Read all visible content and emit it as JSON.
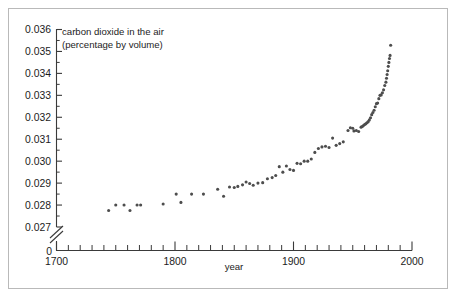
{
  "chart_data": {
    "type": "scatter",
    "title": "carbon dioxide in the air",
    "subtitle": "(percentage by volume)",
    "xlabel": "year",
    "ylabel": "",
    "xlim": [
      1700,
      2000
    ],
    "ylim": [
      0.027,
      0.036
    ],
    "y_axis_break": true,
    "y_axis_zero_label": "0",
    "grid": false,
    "legend": null,
    "x_ticks": [
      1700,
      1800,
      1900,
      2000
    ],
    "x_tick_labels": [
      "1700",
      "1800",
      "1900",
      "2000"
    ],
    "x_minor_tick_step": 10,
    "y_ticks": [
      0.027,
      0.028,
      0.029,
      0.03,
      0.031,
      0.032,
      0.033,
      0.034,
      0.035,
      0.036
    ],
    "y_tick_labels": [
      "0.027",
      "0.028",
      "0.029",
      "0.030",
      "0.031",
      "0.032",
      "0.033",
      "0.034",
      "0.035",
      "0.036"
    ],
    "y_minor_tick_step": 0.0005,
    "marker_color": "#4d4d4d",
    "marker_size": 3.1,
    "points": [
      [
        1744,
        0.02775
      ],
      [
        1750,
        0.028
      ],
      [
        1757,
        0.028
      ],
      [
        1762,
        0.02775
      ],
      [
        1768,
        0.028
      ],
      [
        1771,
        0.028
      ],
      [
        1790,
        0.02805
      ],
      [
        1801,
        0.0285
      ],
      [
        1805,
        0.02812
      ],
      [
        1814,
        0.0285
      ],
      [
        1824,
        0.0285
      ],
      [
        1836,
        0.02872
      ],
      [
        1841,
        0.0284
      ],
      [
        1846,
        0.02882
      ],
      [
        1850,
        0.0288
      ],
      [
        1853,
        0.02885
      ],
      [
        1857,
        0.02892
      ],
      [
        1860,
        0.02905
      ],
      [
        1863,
        0.02898
      ],
      [
        1866,
        0.0289
      ],
      [
        1870,
        0.029
      ],
      [
        1874,
        0.02902
      ],
      [
        1878,
        0.0292
      ],
      [
        1882,
        0.02925
      ],
      [
        1885,
        0.02935
      ],
      [
        1888,
        0.02975
      ],
      [
        1891,
        0.0295
      ],
      [
        1894,
        0.02978
      ],
      [
        1897,
        0.02962
      ],
      [
        1900,
        0.02958
      ],
      [
        1903,
        0.0299
      ],
      [
        1906,
        0.02988
      ],
      [
        1909,
        0.03
      ],
      [
        1912,
        0.03
      ],
      [
        1915,
        0.0301
      ],
      [
        1918,
        0.0304
      ],
      [
        1921,
        0.03058
      ],
      [
        1924,
        0.03065
      ],
      [
        1927,
        0.03068
      ],
      [
        1930,
        0.03062
      ],
      [
        1933,
        0.03105
      ],
      [
        1936,
        0.03072
      ],
      [
        1939,
        0.0308
      ],
      [
        1942,
        0.03088
      ],
      [
        1946,
        0.0314
      ],
      [
        1948,
        0.03152
      ],
      [
        1950,
        0.0315
      ],
      [
        1951,
        0.03138
      ],
      [
        1953,
        0.0314
      ],
      [
        1955,
        0.03135
      ],
      [
        1957,
        0.03155
      ],
      [
        1958,
        0.03158
      ],
      [
        1959,
        0.03162
      ],
      [
        1960,
        0.03167
      ],
      [
        1961,
        0.0317
      ],
      [
        1962,
        0.03175
      ],
      [
        1963,
        0.0318
      ],
      [
        1964,
        0.03188
      ],
      [
        1965,
        0.03198
      ],
      [
        1966,
        0.03212
      ],
      [
        1967,
        0.03222
      ],
      [
        1968,
        0.03232
      ],
      [
        1969,
        0.03248
      ],
      [
        1970,
        0.03262
      ],
      [
        1971,
        0.03265
      ],
      [
        1972,
        0.03285
      ],
      [
        1973,
        0.033
      ],
      [
        1974,
        0.03302
      ],
      [
        1975,
        0.03312
      ],
      [
        1976,
        0.03325
      ],
      [
        1977,
        0.03345
      ],
      [
        1978,
        0.0336
      ],
      [
        1978.5,
        0.03378
      ],
      [
        1979,
        0.03395
      ],
      [
        1979.5,
        0.03412
      ],
      [
        1980,
        0.03432
      ],
      [
        1980.5,
        0.0345
      ],
      [
        1981,
        0.03468
      ],
      [
        1981.5,
        0.03482
      ],
      [
        1982,
        0.03528
      ]
    ]
  }
}
